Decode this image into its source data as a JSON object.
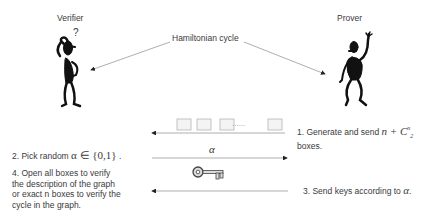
{
  "actors": {
    "verifier": {
      "label": "Verifier",
      "icon": "stick-figure-thinking",
      "question_mark": "?"
    },
    "prover": {
      "label": "Prover",
      "icon": "stick-figure-waving"
    }
  },
  "center_label": "Hamiltonian cycle",
  "boxes": {
    "count_visible": 4,
    "ellipsis": "......"
  },
  "alpha_symbol": "α",
  "key_icon": "key-icon",
  "steps": {
    "step1": {
      "text": "1. Generate and send ",
      "math": "n + C",
      "math_sup": "n",
      "math_sub": "2",
      "text_after": "boxes."
    },
    "step2": {
      "text": "2. Pick random ",
      "math": "α ∈ {0,1}",
      "suffix": " ."
    },
    "step3": {
      "text": "3. Send keys according to ",
      "math": "α",
      "suffix": "."
    },
    "step4": {
      "lines": [
        "4. Open all boxes to verify",
        "the description of the graph",
        "or exact n boxes to verify the",
        "cycle in the graph."
      ]
    }
  },
  "colors": {
    "line": "#8a8a8a",
    "figure": "#111111",
    "box_border": "#b0b0b0"
  }
}
